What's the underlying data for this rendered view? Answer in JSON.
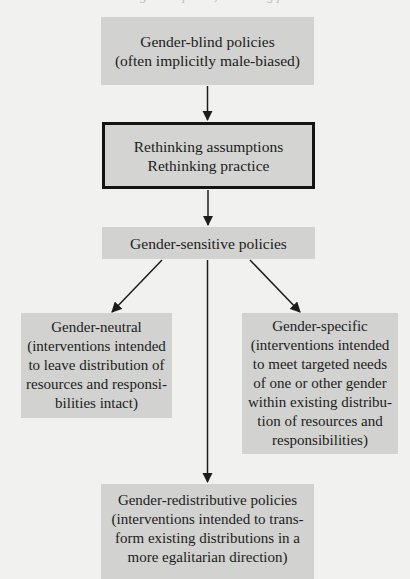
{
  "diagram": {
    "top_cut_text": "Rethinking assumptions, rethinking practice",
    "nodes": {
      "gender_blind": {
        "lines": [
          "Gender-blind policies",
          "(often implicitly male-biased)"
        ]
      },
      "rethinking": {
        "lines": [
          "Rethinking assumptions",
          "Rethinking practice"
        ]
      },
      "gender_sensitive": {
        "lines": [
          "Gender-sensitive policies"
        ]
      },
      "gender_neutral": {
        "lines": [
          "Gender-neutral",
          "(interventions intended",
          "to leave distribution of",
          "resources and responsi-",
          "bilities intact)"
        ]
      },
      "gender_specific": {
        "lines": [
          "Gender-specific",
          "(interventions intended",
          "to meet targeted needs",
          "of one or other gender",
          "within existing distribu-",
          "tion of resources and",
          "responsibilities)"
        ]
      },
      "gender_redistributive": {
        "lines": [
          "Gender-redistributive policies",
          "(interventions intended to trans-",
          "form existing distributions in a",
          "more egalitarian direction)"
        ]
      }
    },
    "edges": [
      {
        "from": "gender_blind",
        "to": "rethinking"
      },
      {
        "from": "rethinking",
        "to": "gender_sensitive"
      },
      {
        "from": "gender_sensitive",
        "to": "gender_neutral"
      },
      {
        "from": "gender_sensitive",
        "to": "gender_specific"
      },
      {
        "from": "gender_sensitive",
        "to": "gender_redistributive"
      }
    ],
    "colors": {
      "box_fill": "#d2d2d0",
      "background": "#f1f1ef",
      "line": "#1c1c1c"
    }
  }
}
